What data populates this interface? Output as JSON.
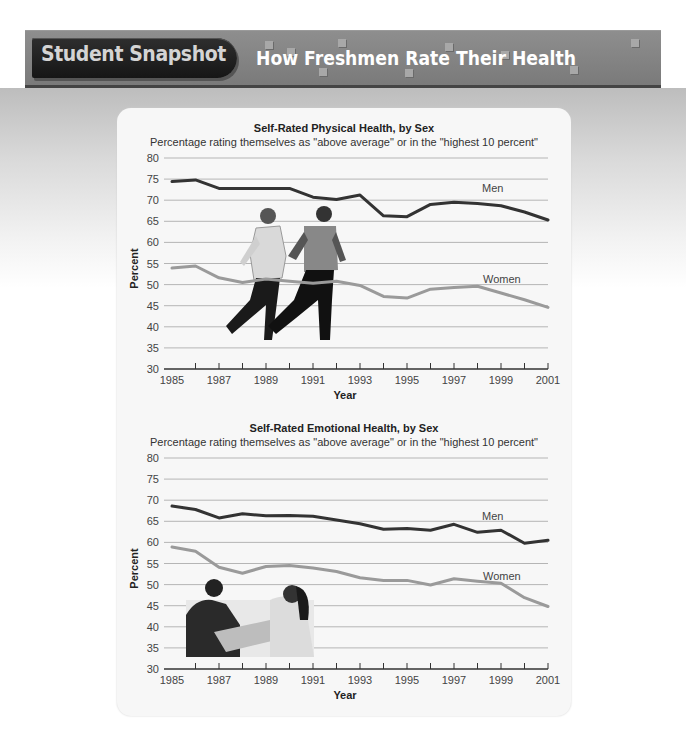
{
  "banner": {
    "badge_label": "Student Snapshot",
    "title": "How Freshmen Rate Their Health"
  },
  "colors": {
    "men_line": "#333333",
    "women_line": "#9a9a9a",
    "gridline": "#b5b5b5",
    "axis": "#333333"
  },
  "chart_data": [
    {
      "type": "line",
      "title": "Self-Rated Physical Health, by Sex",
      "subtitle": "Percentage rating themselves as \"above average\" or in the \"highest 10 percent\"",
      "xlabel": "Year",
      "ylabel": "Percent",
      "ylim": [
        30,
        80
      ],
      "yticks": [
        30,
        35,
        40,
        45,
        50,
        55,
        60,
        65,
        70,
        75,
        80
      ],
      "xticks": [
        "1985",
        "1987",
        "1989",
        "1991",
        "1993",
        "1995",
        "1997",
        "1999",
        "2001"
      ],
      "grid": true,
      "legend_position": "inline labels at right",
      "x": [
        1985,
        1986,
        1987,
        1988,
        1989,
        1990,
        1991,
        1992,
        1993,
        1994,
        1995,
        1996,
        1997,
        1998,
        1999,
        2000,
        2001
      ],
      "series": [
        {
          "name": "Men",
          "values": [
            74.4,
            74.8,
            72.8,
            72.8,
            72.8,
            72.8,
            70.7,
            70.2,
            71.2,
            66.3,
            66.1,
            69.0,
            69.5,
            69.2,
            68.7,
            67.2,
            65.3
          ]
        },
        {
          "name": "Women",
          "values": [
            53.9,
            54.4,
            51.6,
            50.5,
            51.3,
            50.8,
            50.3,
            50.8,
            49.8,
            47.2,
            46.8,
            48.9,
            49.3,
            49.6,
            48.0,
            46.4,
            44.6
          ]
        }
      ]
    },
    {
      "type": "line",
      "title": "Self-Rated Emotional Health, by Sex",
      "subtitle": "Percentage rating themselves as \"above average\" or in the \"highest 10 percent\"",
      "xlabel": "Year",
      "ylabel": "Percent",
      "ylim": [
        30,
        80
      ],
      "yticks": [
        30,
        35,
        40,
        45,
        50,
        55,
        60,
        65,
        70,
        75,
        80
      ],
      "xticks": [
        "1985",
        "1987",
        "1989",
        "1991",
        "1993",
        "1995",
        "1997",
        "1999",
        "2001"
      ],
      "grid": true,
      "legend_position": "inline labels at right",
      "x": [
        1985,
        1986,
        1987,
        1988,
        1989,
        1990,
        1991,
        1992,
        1993,
        1994,
        1995,
        1996,
        1997,
        1998,
        1999,
        2000,
        2001
      ],
      "series": [
        {
          "name": "Men",
          "values": [
            68.6,
            67.8,
            65.8,
            66.8,
            66.3,
            66.4,
            66.2,
            65.3,
            64.4,
            63.1,
            63.3,
            62.9,
            64.3,
            62.4,
            62.9,
            59.8,
            60.5
          ]
        },
        {
          "name": "Women",
          "values": [
            58.9,
            57.9,
            54.1,
            52.7,
            54.3,
            54.5,
            53.9,
            53.1,
            51.6,
            51.0,
            51.0,
            49.9,
            51.4,
            50.8,
            50.3,
            46.9,
            44.8
          ]
        }
      ]
    }
  ],
  "charts": [
    {
      "title": "Self-Rated Physical Health, by Sex",
      "subtitle": "Percentage rating themselves as \"above average\" or in the \"highest 10 percent\"",
      "xlabel": "Year",
      "ylabel": "Percent",
      "men_label": "Men",
      "women_label": "Women",
      "illustration": "running-couple-photo"
    },
    {
      "title": "Self-Rated Emotional Health, by Sex",
      "subtitle": "Percentage rating themselves as \"above average\" or in the \"highest 10 percent\"",
      "xlabel": "Year",
      "ylabel": "Percent",
      "men_label": "Men",
      "women_label": "Women",
      "illustration": "couple-at-table-photo"
    }
  ]
}
